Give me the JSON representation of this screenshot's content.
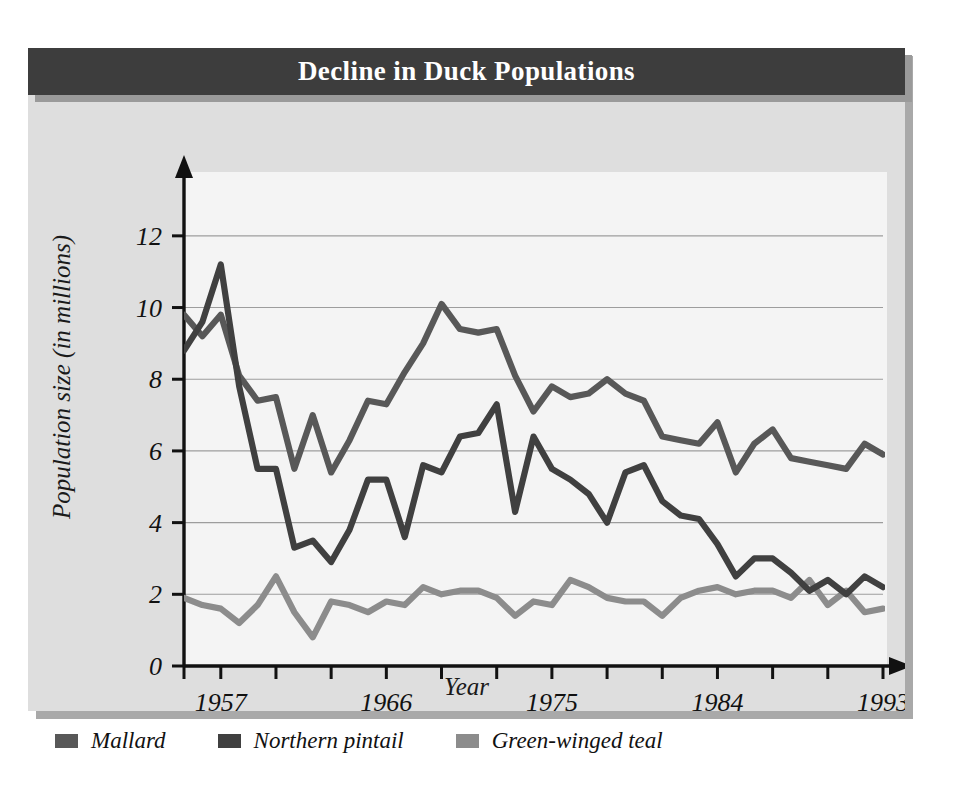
{
  "title": "Decline in Duck Populations",
  "axis": {
    "ylabel": "Population size (in millions)",
    "xlabel": "Year"
  },
  "legend": [
    {
      "label": "Mallard",
      "color": "#585858"
    },
    {
      "label": "Northern pintail",
      "color": "#404040"
    },
    {
      "label": "Green-winged teal",
      "color": "#8c8c8c"
    }
  ],
  "colors": {
    "banner": "#3d3d3d",
    "card": "#dedede",
    "plot_bg": "#f2f2f2",
    "axis": "#111111",
    "gridline": "#8f8f8f",
    "mallard": "#585858",
    "northern_pintail": "#404040",
    "green_winged_teal": "#8c8c8c"
  },
  "chart_data": {
    "type": "line",
    "title": "Decline in Duck Populations",
    "xlabel": "Year",
    "ylabel": "Population size (in millions)",
    "xlim": [
      1955,
      1993
    ],
    "ylim": [
      0,
      13
    ],
    "yticks": [
      0,
      2,
      4,
      6,
      8,
      10,
      12
    ],
    "xticks_major": [
      1957,
      1966,
      1975,
      1984,
      1993
    ],
    "xticks_minor_step": 3,
    "grid": "horizontal",
    "legend_position": "below-chart",
    "x": [
      1955,
      1956,
      1957,
      1958,
      1959,
      1960,
      1961,
      1962,
      1963,
      1964,
      1965,
      1966,
      1967,
      1968,
      1969,
      1970,
      1971,
      1972,
      1973,
      1974,
      1975,
      1976,
      1977,
      1978,
      1979,
      1980,
      1981,
      1982,
      1983,
      1984,
      1985,
      1986,
      1987,
      1988,
      1989,
      1990,
      1991,
      1992,
      1993
    ],
    "series": [
      {
        "name": "Mallard",
        "color": "#585858",
        "values": [
          9.8,
          9.2,
          9.8,
          8.1,
          7.4,
          7.5,
          5.5,
          7.0,
          5.4,
          6.3,
          7.4,
          7.3,
          8.2,
          9.0,
          10.1,
          9.4,
          9.3,
          9.4,
          8.1,
          7.1,
          7.8,
          7.5,
          7.6,
          8.0,
          7.6,
          7.4,
          6.4,
          6.3,
          6.2,
          6.8,
          5.4,
          6.2,
          6.6,
          5.8,
          5.7,
          5.6,
          5.5,
          6.2,
          5.9
        ]
      },
      {
        "name": "Northern pintail",
        "color": "#404040",
        "values": [
          8.8,
          9.6,
          11.2,
          7.8,
          5.5,
          5.5,
          3.3,
          3.5,
          2.9,
          3.8,
          5.2,
          5.2,
          3.6,
          5.6,
          5.4,
          6.4,
          6.5,
          7.3,
          4.3,
          6.4,
          5.5,
          5.2,
          4.8,
          4.0,
          5.4,
          5.6,
          4.6,
          4.2,
          4.1,
          3.4,
          2.5,
          3.0,
          3.0,
          2.6,
          2.1,
          2.4,
          2.0,
          2.5,
          2.2
        ]
      },
      {
        "name": "Green-winged teal",
        "color": "#8c8c8c",
        "values": [
          1.9,
          1.7,
          1.6,
          1.2,
          1.7,
          2.5,
          1.5,
          0.8,
          1.8,
          1.7,
          1.5,
          1.8,
          1.7,
          2.2,
          2.0,
          2.1,
          2.1,
          1.9,
          1.4,
          1.8,
          1.7,
          2.4,
          2.2,
          1.9,
          1.8,
          1.8,
          1.4,
          1.9,
          2.1,
          2.2,
          2.0,
          2.1,
          2.1,
          1.9,
          2.4,
          1.7,
          2.1,
          1.5,
          1.6
        ]
      }
    ]
  }
}
